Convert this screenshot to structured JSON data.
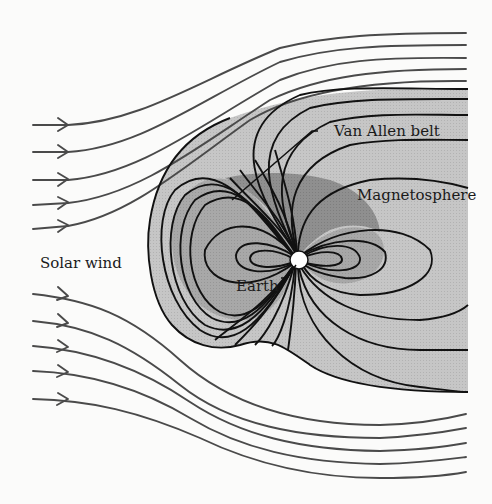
{
  "diagram": {
    "labels": {
      "solar_wind": "Solar wind",
      "van_allen_belt": "Van Allen belt",
      "magnetosphere": "Magnetosphere",
      "earth": "Earth"
    },
    "colors": {
      "background": "#fbfbfa",
      "magnetosphere_fill": "#c4c4c4",
      "inner_region_fill": "#a6a6a6",
      "van_allen_fill": "#8e8e8e",
      "field_line": "#111111",
      "solar_wind_line": "#4a4a4a",
      "earth_fill": "#ffffff"
    },
    "solar_wind": {
      "upper_stream_count": 5,
      "lower_stream_count": 5,
      "arrow_direction": "right"
    },
    "elements": [
      {
        "id": "solar-wind-streams",
        "description": "Curved streamlines with arrowheads flowing left to right, deflected around the magnetosphere"
      },
      {
        "id": "magnetosphere",
        "description": "Gray region bounded by compressed dayside and elongated nightside tail"
      },
      {
        "id": "van-allen-belt",
        "description": "Darker shaded lobe above and around Earth"
      },
      {
        "id": "earth",
        "description": "Small white circle at the dipole center"
      },
      {
        "id": "dipole-field-lines",
        "description": "Black magnetic field lines converging at the poles"
      }
    ]
  }
}
